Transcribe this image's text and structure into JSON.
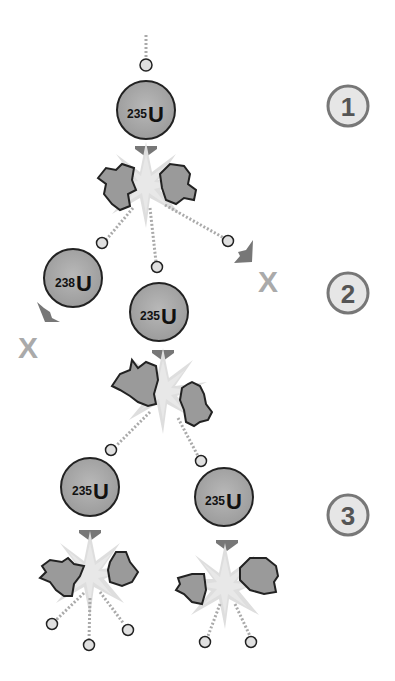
{
  "diagram": {
    "steps": [
      {
        "label": "1"
      },
      {
        "label": "2"
      },
      {
        "label": "3"
      }
    ],
    "nuclei": [
      {
        "id": "u235-top",
        "mass": "235",
        "symbol": "U"
      },
      {
        "id": "u238-left",
        "mass": "238",
        "symbol": "U"
      },
      {
        "id": "u235-mid",
        "mass": "235",
        "symbol": "U"
      },
      {
        "id": "u235-bottom-left",
        "mass": "235",
        "symbol": "U"
      },
      {
        "id": "u235-bottom-right",
        "mass": "235",
        "symbol": "U"
      }
    ],
    "lost_marker": "X",
    "colors": {
      "nucleus_fill": "#a9a9a9",
      "fragment_fill": "#9a9a9a",
      "burst": "#dcdcdc",
      "arrow": "#777777",
      "neutron_fill": "#e0e0e0",
      "step_circle": "#e6e6e6",
      "step_border": "#777777",
      "x_color": "#aaaaaa"
    }
  }
}
